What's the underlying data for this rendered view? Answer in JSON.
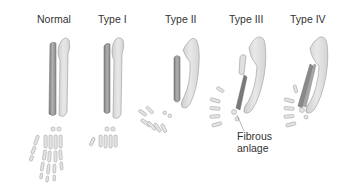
{
  "diagram": {
    "panels": [
      {
        "id": "normal",
        "label": "Normal"
      },
      {
        "id": "type1",
        "label": "Type I"
      },
      {
        "id": "type2",
        "label": "Type II"
      },
      {
        "id": "type3",
        "label": "Type III"
      },
      {
        "id": "type4",
        "label": "Type IV"
      }
    ],
    "annotations": [
      {
        "text_line1": "Fibrous",
        "text_line2": "anlage",
        "points_to": "type3"
      }
    ],
    "colors": {
      "background": "#ffffff",
      "ulna_fill": "#dcdcdc",
      "radius_fill": "#9a9a9a",
      "outline": "#8c8c8c",
      "bone_light": "#e2e2e2",
      "text": "#333333"
    }
  }
}
